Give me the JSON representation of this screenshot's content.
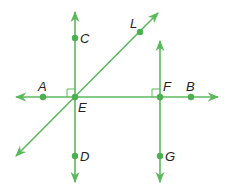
{
  "diagram": {
    "line_color": "#5cb85c",
    "point_color": "#4caf50",
    "label_color": "#222222",
    "points": {
      "A": {
        "label": "A",
        "x": 43,
        "y": 97
      },
      "B": {
        "label": "B",
        "x": 191,
        "y": 97
      },
      "C": {
        "label": "C",
        "x": 75,
        "y": 38
      },
      "D": {
        "label": "D",
        "x": 75,
        "y": 156
      },
      "E": {
        "label": "E",
        "x": 75,
        "y": 97
      },
      "F": {
        "label": "F",
        "x": 160,
        "y": 97
      },
      "G": {
        "label": "G",
        "x": 160,
        "y": 156
      },
      "L": {
        "label": "L",
        "x": 140,
        "y": 32
      }
    },
    "lines": [
      {
        "name": "line-AB",
        "from": [
          16,
          97
        ],
        "to": [
          218,
          97
        ],
        "arrows": "both"
      },
      {
        "name": "line-CD",
        "from": [
          75,
          12
        ],
        "to": [
          75,
          182
        ],
        "arrows": "both"
      },
      {
        "name": "line-EL",
        "from": [
          16,
          156
        ],
        "to": [
          158,
          13
        ],
        "arrows": "both"
      },
      {
        "name": "ray-FG",
        "from": [
          160,
          41
        ],
        "to": [
          160,
          182
        ],
        "arrows": "both"
      }
    ],
    "right_angles": [
      {
        "at": "E",
        "quadrant": "upper-left"
      },
      {
        "at": "F",
        "quadrant": "upper-left"
      }
    ]
  }
}
